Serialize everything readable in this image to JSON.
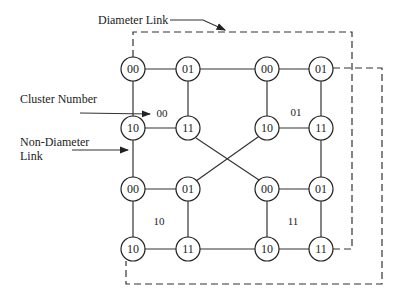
{
  "annotations": {
    "diameter_link": "Diameter Link",
    "cluster_number": "Cluster Number",
    "non_diameter_link_line1": "Non-Diameter",
    "non_diameter_link_line2": "Link"
  },
  "clusters": [
    {
      "id": "00",
      "label": "00",
      "nodes": [
        "00",
        "01",
        "10",
        "11"
      ]
    },
    {
      "id": "01",
      "label": "01",
      "nodes": [
        "00",
        "01",
        "10",
        "11"
      ]
    },
    {
      "id": "10",
      "label": "10",
      "nodes": [
        "00",
        "01",
        "10",
        "11"
      ]
    },
    {
      "id": "11",
      "label": "11",
      "nodes": [
        "00",
        "01",
        "10",
        "11"
      ]
    }
  ],
  "colors": {
    "stroke": "#333333",
    "background": "#ffffff"
  }
}
